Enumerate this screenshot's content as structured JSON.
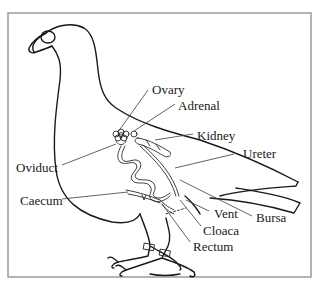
{
  "diagram": {
    "labels": {
      "ovary": "Ovary",
      "adrenal": "Adrenal",
      "kidney": "Kidney",
      "ureter": "Ureter",
      "oviduct": "Oviduct",
      "caecum": "Caecum",
      "vent": "Vent",
      "bursa": "Bursa",
      "cloaca": "Cloaca",
      "rectum": "Rectum"
    },
    "colors": {
      "line": "#1a1a1a",
      "frame": "#9a9a9a",
      "background": "#ffffff"
    }
  }
}
